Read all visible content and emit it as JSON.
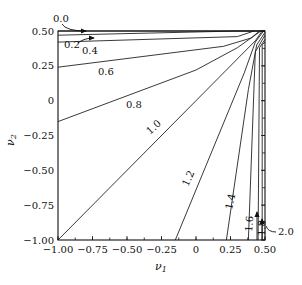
{
  "chart_data": {
    "type": "contour",
    "title": "",
    "xlabel": "ν1",
    "ylabel": "ν2",
    "xlim": [
      -1.0,
      0.5
    ],
    "ylim": [
      -1.0,
      0.5
    ],
    "x_ticks": [
      "−1.00",
      "−0.75",
      "−0.50",
      "−0.25",
      "0",
      "0.25",
      "0.50"
    ],
    "y_ticks": [
      "−1.00",
      "−0.75",
      "−0.50",
      "−0.25",
      "0",
      "0.25",
      "0.50"
    ],
    "grid": false,
    "contour_levels": [
      "0.0",
      "0.2",
      "0.4",
      "0.6",
      "0.8",
      "1.0",
      "1.2",
      "1.4",
      "1.6",
      "1.8",
      "2.0"
    ],
    "contours": [
      {
        "level": "0.0",
        "points": [
          [
            -1.0,
            0.5
          ],
          [
            0.5,
            0.5
          ]
        ]
      },
      {
        "level": "0.2",
        "points": [
          [
            -1.0,
            0.47
          ],
          [
            0.3,
            0.5
          ],
          [
            0.5,
            0.5
          ]
        ]
      },
      {
        "level": "0.4",
        "points": [
          [
            -1.0,
            0.42
          ],
          [
            0.3,
            0.46
          ],
          [
            0.42,
            0.5
          ]
        ]
      },
      {
        "level": "0.6",
        "points": [
          [
            -1.0,
            0.24
          ],
          [
            0.2,
            0.39
          ],
          [
            0.4,
            0.45
          ],
          [
            0.46,
            0.5
          ]
        ]
      },
      {
        "level": "0.8",
        "points": [
          [
            -1.0,
            -0.15
          ],
          [
            0.0,
            0.22
          ],
          [
            0.3,
            0.38
          ],
          [
            0.47,
            0.5
          ]
        ]
      },
      {
        "level": "1.0",
        "points": [
          [
            -1.0,
            -1.0
          ],
          [
            0.43,
            0.43
          ],
          [
            0.48,
            0.5
          ]
        ]
      },
      {
        "level": "1.2",
        "points": [
          [
            -0.15,
            -1.0
          ],
          [
            0.35,
            0.2
          ],
          [
            0.43,
            0.42
          ],
          [
            0.49,
            0.5
          ]
        ]
      },
      {
        "level": "1.4",
        "points": [
          [
            0.22,
            -1.0
          ],
          [
            0.38,
            0.08
          ],
          [
            0.44,
            0.4
          ],
          [
            0.5,
            0.49
          ]
        ]
      },
      {
        "level": "1.6",
        "points": [
          [
            0.38,
            -1.0
          ],
          [
            0.43,
            0.35
          ],
          [
            0.5,
            0.47
          ]
        ]
      },
      {
        "level": "1.8",
        "points": [
          [
            0.45,
            -1.0
          ],
          [
            0.46,
            0.38
          ],
          [
            0.5,
            0.44
          ]
        ]
      },
      {
        "level": "2.0",
        "points": [
          [
            0.48,
            -1.0
          ],
          [
            0.48,
            0.4
          ],
          [
            0.5,
            0.42
          ]
        ]
      }
    ],
    "annotations": [
      {
        "text": "0.0",
        "arrow_to": [
          -0.55,
          0.5
        ]
      },
      {
        "text": "0.2",
        "arrow_to": [
          -0.45,
          0.47
        ]
      },
      {
        "text": "1.8",
        "arrow_to": [
          0.46,
          -0.85
        ]
      },
      {
        "text": "2.0",
        "arrow_to": [
          0.48,
          -0.9
        ]
      }
    ]
  }
}
